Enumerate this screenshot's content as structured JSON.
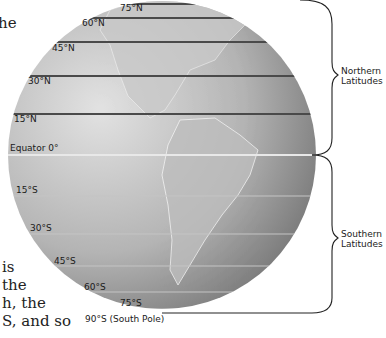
{
  "body_text_fragments": {
    "top": "he",
    "bottom_lines": [
      "is",
      "the",
      "h, the",
      "S, and so"
    ]
  },
  "diagram": {
    "colors": {
      "globe_light": "#d4d4d4",
      "globe_dark": "#6e6e6e",
      "line_north": "#4a4a4a",
      "line_equator": "#e6e6e6",
      "line_south": "#b8b8b8",
      "brace": "#222222"
    },
    "latitude_labels": {
      "n75": "75°N",
      "n60": "60°N",
      "n45": "45°N",
      "n30": "30°N",
      "n15": "15°N",
      "equator": "Equator 0°",
      "s15": "15°S",
      "s30": "30°S",
      "s45": "45°S",
      "s60": "60°S",
      "s75": "75°S",
      "s90": "90°S (South Pole)"
    },
    "brace_labels": {
      "north_line1": "Northern",
      "north_line2": "Latitudes",
      "south_line1": "Southern",
      "south_line2": "Latitudes"
    }
  }
}
